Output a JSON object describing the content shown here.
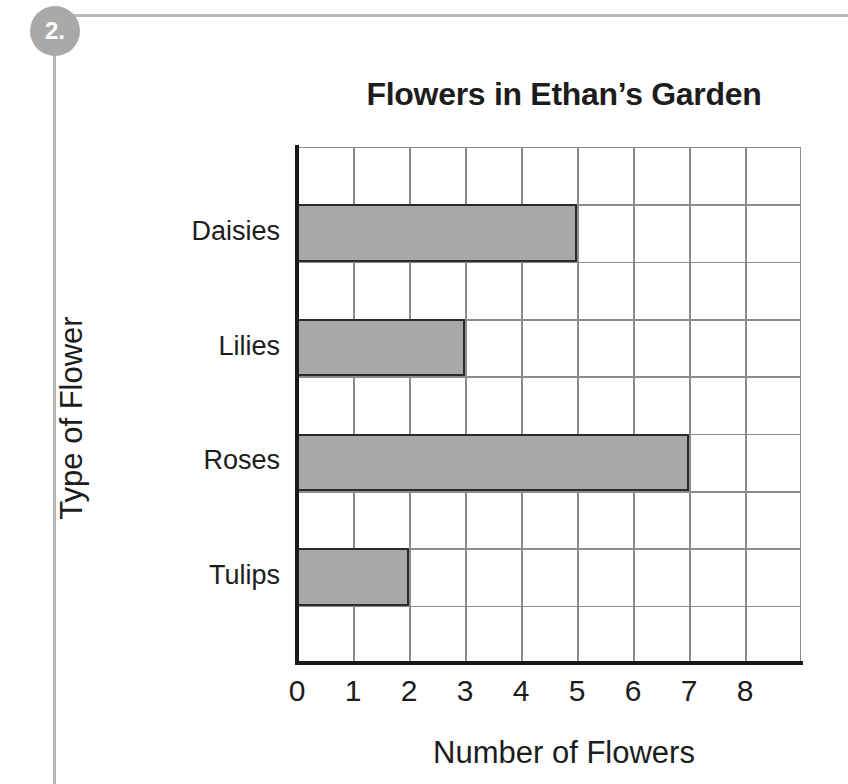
{
  "worksheet": {
    "question_number": "2."
  },
  "chart_data": {
    "type": "bar",
    "orientation": "horizontal",
    "title": "Flowers in Ethan’s Garden",
    "xlabel": "Number of Flowers",
    "ylabel": "Type of Flower",
    "categories": [
      "Daisies",
      "Lilies",
      "Roses",
      "Tulips"
    ],
    "values": [
      5,
      3,
      7,
      2
    ],
    "xticks": [
      "0",
      "1",
      "2",
      "3",
      "4",
      "5",
      "6",
      "7",
      "8"
    ],
    "xlim": [
      0,
      9
    ],
    "grid": true,
    "legend": false,
    "bar_fill_color": "#a8a8a8",
    "bar_border_color": "#2a2a2a",
    "gridline_color": "#8c8c8c",
    "axis_color": "#1a1a1a",
    "marker_color": "#a9a9a9"
  }
}
